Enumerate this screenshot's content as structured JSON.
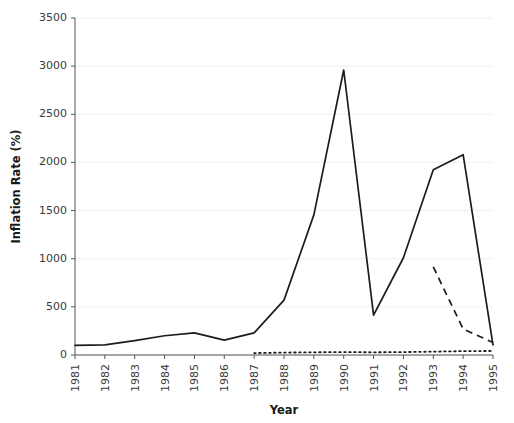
{
  "chart_data": {
    "type": "line",
    "title": "",
    "xlabel": "Year",
    "ylabel": "Inflation Rate (%)",
    "x": [
      1981,
      1982,
      1983,
      1984,
      1985,
      1986,
      1987,
      1988,
      1989,
      1990,
      1991,
      1992,
      1993,
      1994,
      1995
    ],
    "xticklabels": [
      "1981",
      "1982",
      "1983",
      "1984",
      "1985",
      "1986",
      "1987",
      "1988",
      "1989",
      "1990",
      "1991",
      "1992",
      "1993",
      "1994",
      "1995"
    ],
    "yticklabels": [
      "0",
      "500",
      "1000",
      "1500",
      "2000",
      "2500",
      "3000",
      "3500"
    ],
    "yticks": [
      0,
      500,
      1000,
      1500,
      2000,
      2500,
      3000,
      3500
    ],
    "ylim": [
      0,
      3500
    ],
    "xlim": [
      1981,
      1995
    ],
    "grid": true,
    "grid_axis": "y",
    "legend": "none",
    "series": [
      {
        "name": "solid-series",
        "style": "solid",
        "x": [
          1981,
          1982,
          1983,
          1984,
          1985,
          1986,
          1987,
          1988,
          1989,
          1990,
          1991,
          1992,
          1993,
          1994,
          1995
        ],
        "values": [
          100,
          105,
          150,
          200,
          230,
          155,
          230,
          570,
          1455,
          2960,
          415,
          1010,
          1925,
          2080,
          105
        ]
      },
      {
        "name": "dashed-series",
        "style": "dashed",
        "x": [
          1993,
          1994,
          1995
        ],
        "values": [
          915,
          270,
          130
        ]
      },
      {
        "name": "dotted-series",
        "style": "dotted",
        "x": [
          1987,
          1988,
          1989,
          1990,
          1991,
          1992,
          1993,
          1994,
          1995
        ],
        "values": [
          20,
          25,
          28,
          30,
          28,
          30,
          35,
          40,
          42
        ]
      }
    ]
  },
  "axes": {
    "x_title": "Year",
    "y_title": "Inflation Rate (%)"
  }
}
